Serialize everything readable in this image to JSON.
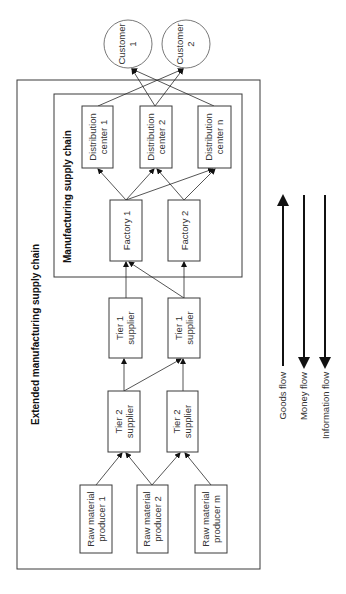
{
  "diagram": {
    "orientation": "rotated 90 degrees counter-clockwise",
    "outer_container": {
      "label": "Extended manufacturing supply chain"
    },
    "inner_container": {
      "label": "Manufacturing supply chain"
    },
    "customers": [
      {
        "line1": "Customer",
        "line2": "1"
      },
      {
        "line1": "Customer",
        "line2": "2"
      }
    ],
    "distribution_centers": [
      {
        "line1": "Distribution",
        "line2": "center 1"
      },
      {
        "line1": "Distribution",
        "line2": "center 2"
      },
      {
        "line1": "Distribution",
        "line2": "center n"
      }
    ],
    "factories": [
      {
        "label": "Factory 1"
      },
      {
        "label": "Factory 2"
      }
    ],
    "tier1_suppliers": [
      {
        "line1": "Tier 1",
        "line2": "supplier"
      },
      {
        "line1": "Tier 1",
        "line2": "supplier"
      }
    ],
    "tier2_suppliers": [
      {
        "line1": "Tier 2",
        "line2": "supplier"
      },
      {
        "line1": "Tier 2",
        "line2": "supplier"
      }
    ],
    "raw_material_producers": [
      {
        "line1": "Raw material",
        "line2": "producer 1"
      },
      {
        "line1": "Raw material",
        "line2": "producer 2"
      },
      {
        "line1": "Raw material",
        "line2": "producer m"
      }
    ],
    "connections": [
      {
        "from": "Raw material producer 1",
        "to": "Tier 2 supplier (1)"
      },
      {
        "from": "Raw material producer 2",
        "to": "Tier 2 supplier (1)"
      },
      {
        "from": "Raw material producer 2",
        "to": "Tier 2 supplier (2)"
      },
      {
        "from": "Raw material producer m",
        "to": "Tier 2 supplier (2)"
      },
      {
        "from": "Tier 2 supplier (1)",
        "to": "Tier 1 supplier (1)"
      },
      {
        "from": "Tier 2 supplier (1)",
        "to": "Tier 1 supplier (2)"
      },
      {
        "from": "Tier 2 supplier (2)",
        "to": "Tier 1 supplier (2)"
      },
      {
        "from": "Tier 1 supplier (1)",
        "to": "Factory 1"
      },
      {
        "from": "Tier 1 supplier (2)",
        "to": "Factory 1"
      },
      {
        "from": "Tier 1 supplier (2)",
        "to": "Factory 2"
      },
      {
        "from": "Factory 1",
        "to": "Distribution center 1"
      },
      {
        "from": "Factory 1",
        "to": "Distribution center 2"
      },
      {
        "from": "Factory 1",
        "to": "Distribution center n"
      },
      {
        "from": "Factory 2",
        "to": "Distribution center 2"
      },
      {
        "from": "Factory 2",
        "to": "Distribution center n"
      },
      {
        "from": "Distribution center 1",
        "to": "Customer 2"
      },
      {
        "from": "Distribution center 2",
        "to": "Customer 1"
      },
      {
        "from": "Distribution center 2",
        "to": "Customer 2"
      },
      {
        "from": "Distribution center n",
        "to": "Customer 1"
      }
    ],
    "legend": [
      {
        "label": "Goods flow",
        "direction": "toward customers"
      },
      {
        "label": "Money flow",
        "direction": "toward producers"
      },
      {
        "label": "Information flow",
        "direction": "toward producers"
      }
    ]
  }
}
